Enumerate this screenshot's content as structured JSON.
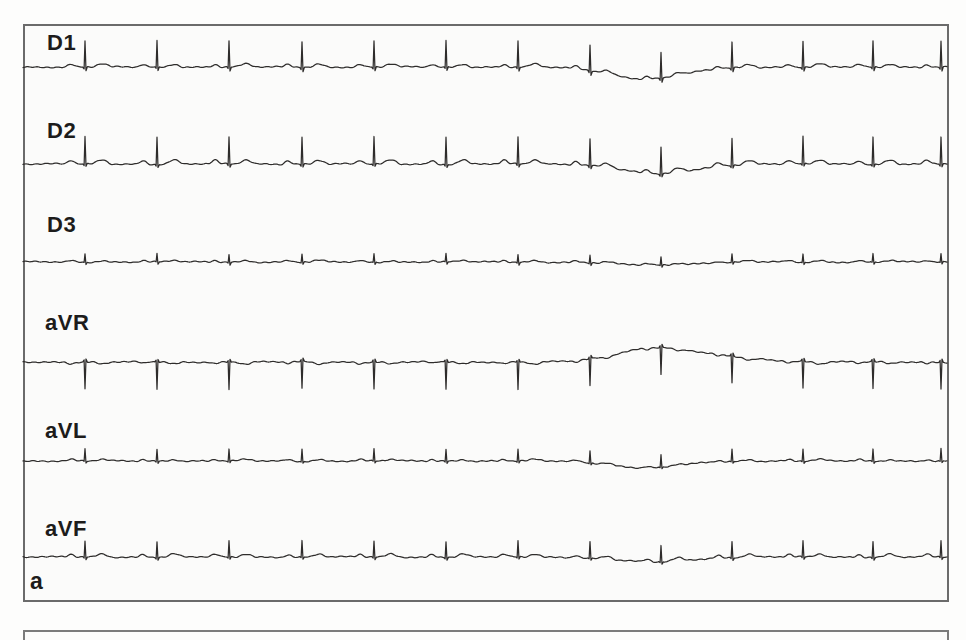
{
  "figure": {
    "panel_label": "a",
    "description_colors": {
      "trace": "#2e2c2b",
      "panel_border": "#6b6b6b",
      "panel_background": "#fbfbfa",
      "page_background": "#fdfdfc",
      "label_text": "#1d1c1b"
    }
  },
  "chart_data": {
    "type": "line",
    "kind": "ecg-multilead-strip",
    "panel_label": "a",
    "lead_names": [
      "D1",
      "D2",
      "D3",
      "aVR",
      "aVL",
      "aVF"
    ],
    "x_range": [
      23,
      947
    ],
    "beat_x": [
      85,
      157,
      229,
      302,
      374,
      446,
      518,
      590,
      661,
      732,
      803,
      873,
      941
    ],
    "beats_per_lead": 13,
    "leads": [
      {
        "name": "D1",
        "baseline_y": 67,
        "p_amp": 2.5,
        "r_amp": 26,
        "s_amp": -4,
        "t_amp": 3,
        "wander": [
          {
            "cx": 648,
            "amp": 12,
            "hw": 52
          }
        ]
      },
      {
        "name": "D2",
        "baseline_y": 164,
        "p_amp": 3.5,
        "r_amp": 27,
        "s_amp": -3,
        "t_amp": 4,
        "wander": [
          {
            "cx": 658,
            "amp": 10,
            "hw": 48
          }
        ]
      },
      {
        "name": "D3",
        "baseline_y": 262,
        "p_amp": 1.5,
        "r_amp": 8,
        "s_amp": -2.5,
        "t_amp": 1.5,
        "wander": [
          {
            "cx": 652,
            "amp": 3,
            "hw": 55
          }
        ]
      },
      {
        "name": "aVR",
        "baseline_y": 362,
        "p_amp": -1.5,
        "r_amp": -27,
        "s_amp": 3,
        "t_amp": -2,
        "wander": [
          {
            "cx": 652,
            "amp": -13,
            "hw": 50
          },
          {
            "cx": 715,
            "amp": -5,
            "hw": 60
          }
        ]
      },
      {
        "name": "aVL",
        "baseline_y": 461,
        "p_amp": 1.5,
        "r_amp": 12,
        "s_amp": -2,
        "t_amp": 1.5,
        "wander": [
          {
            "cx": 648,
            "amp": 7,
            "hw": 48
          }
        ]
      },
      {
        "name": "aVF",
        "baseline_y": 557,
        "p_amp": 2.5,
        "r_amp": 16,
        "s_amp": -2.5,
        "t_amp": 3,
        "wander": [
          {
            "cx": 652,
            "amp": 5,
            "hw": 50
          }
        ]
      }
    ],
    "legend": "none",
    "grid": false,
    "axes_visible": false
  }
}
